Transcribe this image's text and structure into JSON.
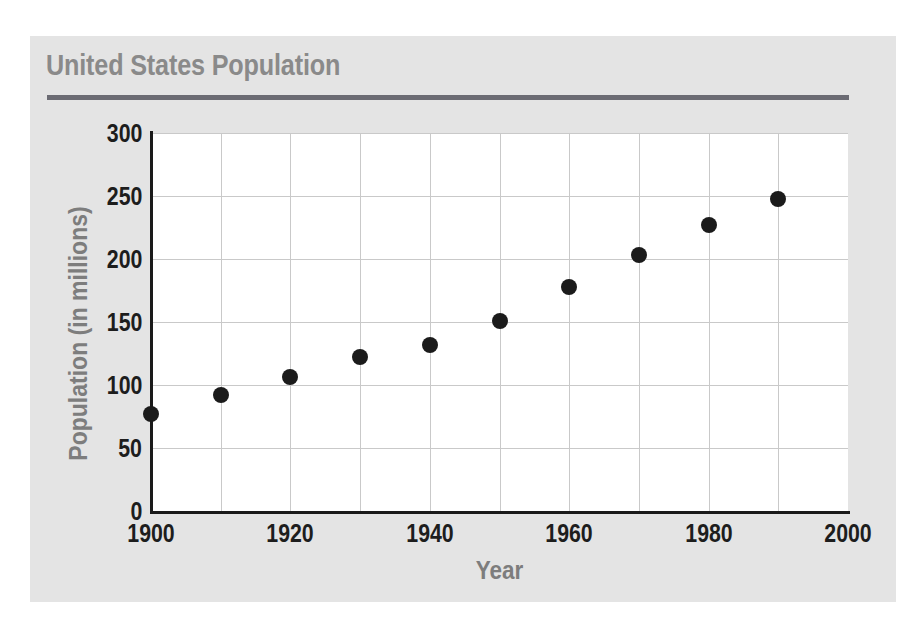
{
  "panel": {
    "background_color": "#e4e4e4",
    "title": "United States Population",
    "title_color": "#8a8a8a",
    "rule_color": "#6b6b73"
  },
  "chart_data": {
    "type": "scatter",
    "title": "United States Population",
    "xlabel": "Year",
    "ylabel": "Population (in millions)",
    "x": [
      1900,
      1910,
      1920,
      1930,
      1940,
      1950,
      1960,
      1970,
      1980,
      1990
    ],
    "values": [
      77,
      92,
      106,
      122,
      132,
      151,
      178,
      203,
      227,
      248
    ],
    "xlim": [
      1900,
      2000
    ],
    "ylim": [
      0,
      300
    ],
    "xticks": [
      1900,
      1920,
      1940,
      1960,
      1980,
      2000
    ],
    "xtick_labels": [
      "1900",
      "1920",
      "1940",
      "1960",
      "1980",
      "2000"
    ],
    "yticks": [
      0,
      50,
      100,
      150,
      200,
      250,
      300
    ],
    "ytick_labels": [
      "0",
      "50",
      "100",
      "150",
      "200",
      "250",
      "300"
    ],
    "x_gridline_step": 10,
    "y_gridline_step": 50,
    "grid": true,
    "legend": false,
    "marker_color": "#1b1b1b",
    "grid_color": "#c9c9c9",
    "axis_color": "#1a1a1a",
    "plot_background": "#ffffff"
  }
}
